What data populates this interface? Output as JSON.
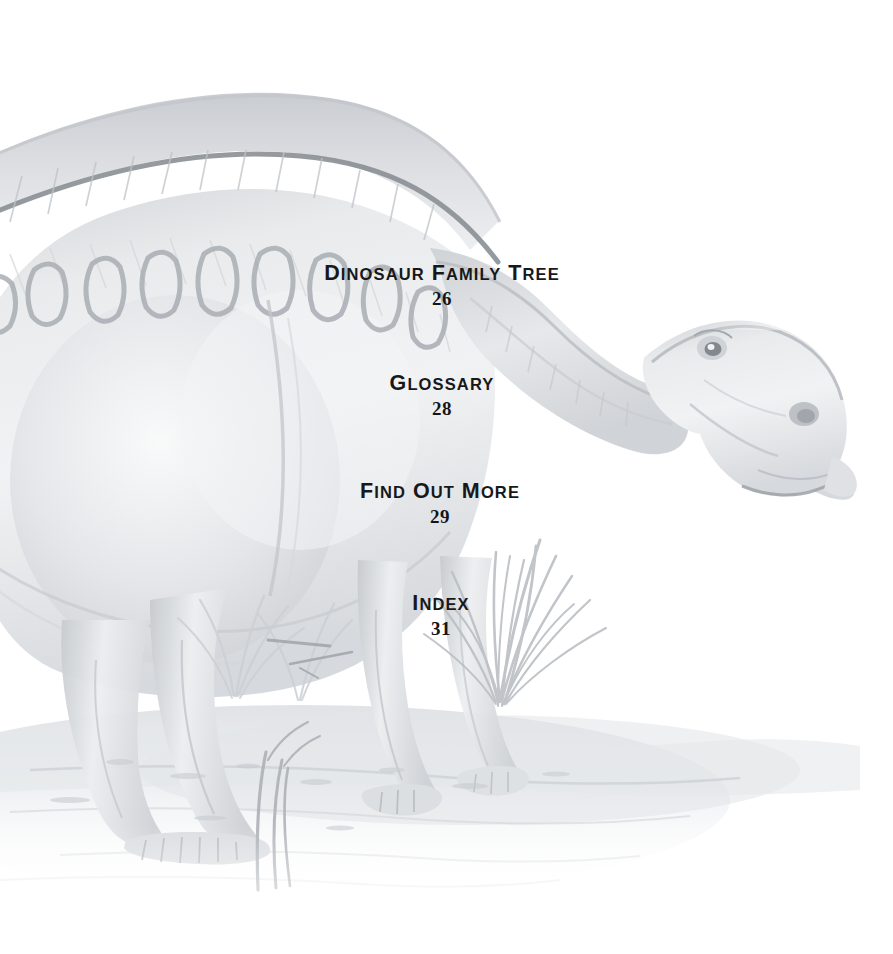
{
  "page": {
    "kind": "book-contents-page",
    "background_color": "#ffffff",
    "width": 893,
    "height": 954
  },
  "illustration": {
    "name": "hadrosaur-dinosaur-watercolor",
    "description": "Pale grayscale watercolor illustration of a sail-backed hadrosaur (duck-billed dinosaur) standing on a marshy shoreline, with tufts of reed grass. The animal faces right, head lowered, mouth slightly open.",
    "alt": "Faded gray watercolor painting of a large duck-billed dinosaur with a ridged back walking across wet ground",
    "palette": {
      "paper": "#ffffff",
      "lightest_wash": "#f4f5f6",
      "mid_wash": "#d8dade",
      "shadow_wash": "#b7bbc0",
      "outline": "#8d9196",
      "dark_accent": "#6f7479"
    }
  },
  "contents": {
    "entries": [
      {
        "title_words": [
          "Dinosaur",
          "Family",
          "Tree"
        ],
        "title": "Dinosaur Family Tree",
        "page": "26"
      },
      {
        "title_words": [
          "Glossary"
        ],
        "title": "Glossary",
        "page": "28"
      },
      {
        "title_words": [
          "Find",
          "Out",
          "More"
        ],
        "title": "Find Out More",
        "page": "29"
      },
      {
        "title_words": [
          "Index"
        ],
        "title": "Index",
        "page": "31"
      }
    ]
  }
}
